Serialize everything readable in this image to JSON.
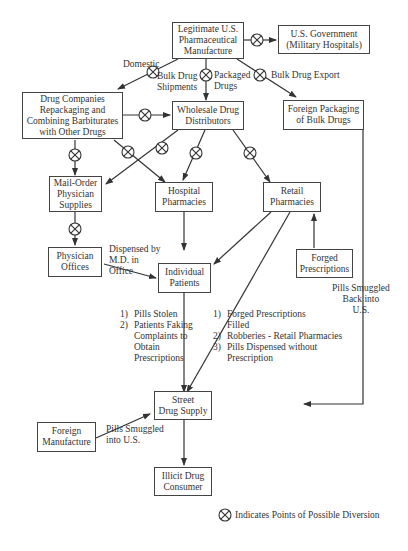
{
  "nodes": {
    "manufacture": "Legitimate U.S.\nPharmaceutical\nManufacture",
    "government": "U.S. Government\n(Military Hospitals)",
    "repackaging": "Drug Companies\nRepackaging and\nCombining Barbiturates\nwith Other Drugs",
    "wholesale": "Wholesale Drug\nDistributors",
    "foreign_packaging": "Foreign Packaging\nof Bulk Drugs",
    "mail_order": "Mail-Order\nPhysician\nSupplies",
    "hospital": "Hospital\nPharmacies",
    "retail": "Retail\nPharmacies",
    "physician_offices": "Physician\nOffices",
    "forged_prescriptions": "Forged\nPrescriptions",
    "patients": "Individual\nPatients",
    "street_supply": "Street\nDrug Supply",
    "foreign_manufacture": "Foreign\nManufacture",
    "consumer": "Illicit Drug\nConsumer"
  },
  "labels": {
    "domestic": "Domestic",
    "bulk_shipments": "Bulk Drug\nShipments",
    "packaged": "Packaged\nDrugs",
    "bulk_export": "Bulk Drug Export",
    "dispensed_md": "Dispensed by\nM.D. in\nOffice",
    "smuggled_back": "Pills Smuggled\nBack into\nU.S.",
    "smuggled_into": "Pills Smuggled\ninto U.S."
  },
  "patient_diversion": [
    {
      "num": "1)",
      "text": "Pills Stolen"
    },
    {
      "num": "2)",
      "text": "Patients Faking\nComplaints to\nObtain\nPrescriptions"
    }
  ],
  "retail_diversion": [
    {
      "num": "1)",
      "text": "Forged Prescriptions\nFilled"
    },
    {
      "num": "2)",
      "text": "Robberies - Retail Pharmacies"
    },
    {
      "num": "3)",
      "text": "Pills Dispensed without\nPrescription"
    }
  ],
  "legend": {
    "icon": "diversion-point-icon",
    "text": "Indicates Points of Possible Diversion"
  },
  "colors": {
    "line": "#333333",
    "box_border": "#444444",
    "text": "#333333"
  }
}
